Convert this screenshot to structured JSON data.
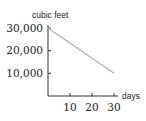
{
  "chart_data": {
    "type": "line",
    "title": "",
    "xlabel": "days",
    "ylabel": "cubic feet",
    "x_ticks": [
      10,
      20,
      30
    ],
    "x_tick_labels": [
      "10",
      "20",
      "30"
    ],
    "y_ticks": [
      10000,
      20000,
      30000
    ],
    "y_tick_labels": [
      "10,000",
      "20,000",
      "30,000"
    ],
    "xlim": [
      0,
      30
    ],
    "ylim": [
      0,
      30000
    ],
    "grid": false,
    "series": [
      {
        "name": "volume",
        "x": [
          0,
          30
        ],
        "y": [
          30000,
          10000
        ],
        "color": "#b0b0b0"
      }
    ]
  },
  "colors": {
    "axis": "#333333",
    "line": "#b0b0b0",
    "text": "#222222"
  }
}
